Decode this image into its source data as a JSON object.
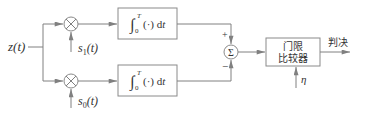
{
  "diagram": {
    "type": "block-diagram",
    "title": "",
    "input": {
      "label": "z(t)"
    },
    "branches": [
      {
        "name": "upper",
        "multiplier": {
          "symbol": "×",
          "reference_signal": "s1(t)",
          "ref_base": "s",
          "ref_sub": "1",
          "ref_arg": "(t)"
        },
        "integrator": {
          "label": "∫0T (·) dt",
          "lower_limit": "0",
          "upper_limit": "T",
          "body": "(·) d",
          "var": "t"
        },
        "summer_sign": "+"
      },
      {
        "name": "lower",
        "multiplier": {
          "symbol": "×",
          "reference_signal": "s0(t)",
          "ref_base": "s",
          "ref_sub": "0",
          "ref_arg": "(t)"
        },
        "integrator": {
          "label": "∫0T (·) dt",
          "lower_limit": "0",
          "upper_limit": "T",
          "body": "(·) d",
          "var": "t"
        },
        "summer_sign": "−"
      }
    ],
    "summer": {
      "symbol": "Σ",
      "plus_sign": "+",
      "minus_sign": "−"
    },
    "comparator": {
      "line1": "门限",
      "line2": "比较器",
      "threshold": "η"
    },
    "output": {
      "label": "判决"
    },
    "colors": {
      "stroke": "#808080",
      "text": "#333333",
      "background": "#ffffff"
    }
  }
}
